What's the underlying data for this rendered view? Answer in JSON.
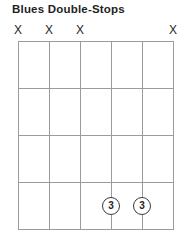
{
  "title": "Blues Double-Stops",
  "colors": {
    "background": "#ffffff",
    "grid_line": "#9b9b9b",
    "ink": "#1f1f1f",
    "marker_outline": "#3a3a3a"
  },
  "diagram": {
    "string_count": 6,
    "fret_count": 4,
    "muted_symbol": "X",
    "muted_strings": [
      1,
      2,
      3,
      6
    ],
    "markers": [
      {
        "string": 4,
        "fret": 4,
        "label": "3"
      },
      {
        "string": 5,
        "fret": 4,
        "label": "3"
      }
    ]
  }
}
